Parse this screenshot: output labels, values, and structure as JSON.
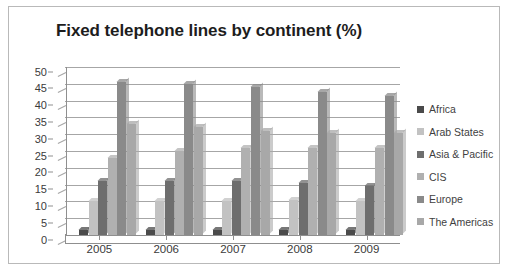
{
  "chart_data": {
    "type": "bar",
    "title": "Fixed telephone lines by continent (%)",
    "xlabel": "",
    "ylabel": "",
    "categories": [
      "2005",
      "2006",
      "2007",
      "2008",
      "2009"
    ],
    "ylim": [
      0,
      50
    ],
    "yticks": [
      0,
      5,
      10,
      15,
      20,
      25,
      30,
      35,
      40,
      45,
      50
    ],
    "grid": true,
    "legend_position": "right",
    "series": [
      {
        "name": "Africa",
        "color": "#4a4a4a",
        "values": [
          1.5,
          1.5,
          1.5,
          1.5,
          1.5
        ]
      },
      {
        "name": "Arab States",
        "color": "#c2c2c2",
        "values": [
          10,
          10,
          10,
          10.5,
          10
        ]
      },
      {
        "name": "Asia & Pacific",
        "color": "#6e6e6e",
        "values": [
          16,
          16,
          16,
          15.5,
          14.5
        ]
      },
      {
        "name": "CIS",
        "color": "#b0b0b0",
        "values": [
          23,
          25,
          26,
          26,
          26
        ]
      },
      {
        "name": "Europe",
        "color": "#8a8a8a",
        "values": [
          45.5,
          45,
          44,
          42.5,
          41.5
        ]
      },
      {
        "name": "The Americas",
        "color": "#a8a8a8",
        "values": [
          33,
          32,
          31,
          30.5,
          30.5
        ]
      }
    ]
  },
  "legend": {
    "items": [
      {
        "label": "Africa"
      },
      {
        "label": "Arab States"
      },
      {
        "label": "Asia & Pacific"
      },
      {
        "label": "CIS"
      },
      {
        "label": "Europe"
      },
      {
        "label": "The Americas"
      }
    ]
  }
}
